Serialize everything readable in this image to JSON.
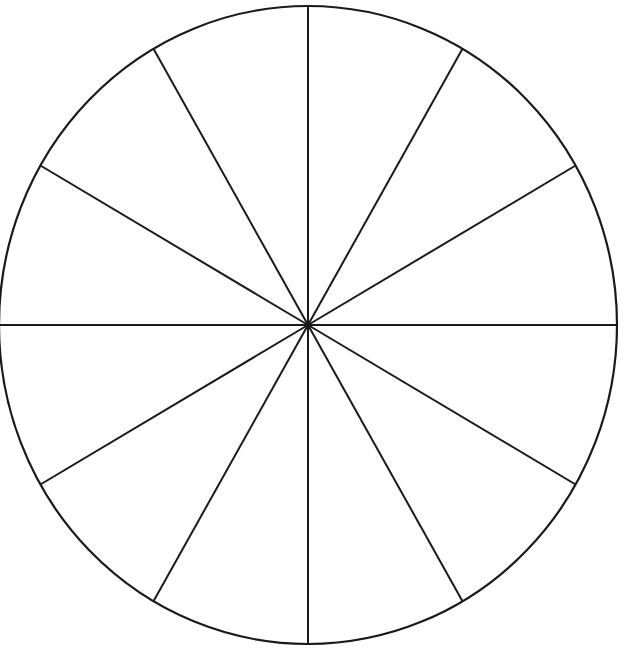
{
  "diagram": {
    "type": "segmented-circle",
    "segments": 12,
    "center": [
      308,
      325
    ],
    "rx": 309,
    "ry": 319,
    "stroke_color": "#1a1a1a",
    "fill_color": "#ffffff",
    "background": "#ffffff"
  }
}
